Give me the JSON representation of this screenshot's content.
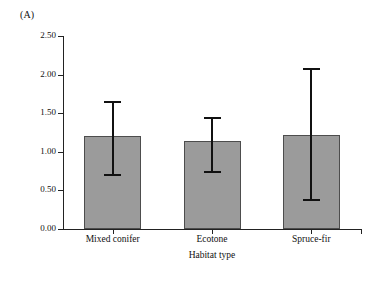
{
  "figure": {
    "panel_label": "(A)",
    "background_color": "#ffffff",
    "bar_fill_color": "#9b9b9b",
    "bar_edge_color": "#4d4d4d",
    "error_bar_color": "#111111",
    "axis_color": "#222222"
  },
  "chart_data": {
    "type": "bar",
    "title": "(A)",
    "xlabel": "Habitat type",
    "ylabel": "Annual population growth rate",
    "categories": [
      "Mixed conifer",
      "Ecotone",
      "Spruce-fir"
    ],
    "values": [
      1.2,
      1.14,
      1.22
    ],
    "error_low": [
      0.7,
      0.74,
      0.38
    ],
    "error_high": [
      1.64,
      1.44,
      2.07
    ],
    "ylim": [
      0.0,
      2.5
    ],
    "ytick_labels": [
      "0.00",
      "0.50",
      "1.00",
      "1.50",
      "2.00",
      "2.50"
    ],
    "ytick_values": [
      0.0,
      0.5,
      1.0,
      1.5,
      2.0,
      2.5
    ],
    "grid": false,
    "legend": null
  }
}
